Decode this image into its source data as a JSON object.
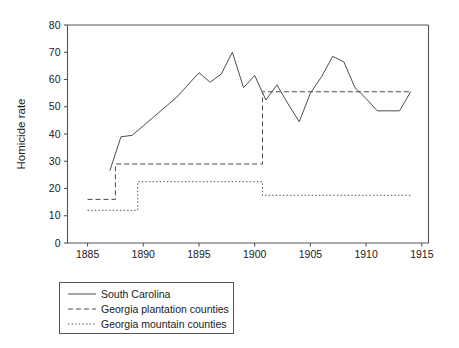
{
  "chart_data": {
    "type": "line",
    "title": "",
    "subtitle": "",
    "xlabel": "",
    "ylabel": "Homicide rate",
    "xlim": [
      1883.2,
      1915.6
    ],
    "ylim": [
      0,
      80
    ],
    "grid": false,
    "legend_position": "below-plot-left",
    "x_ticks": [
      1885,
      1890,
      1895,
      1900,
      1905,
      1910,
      1915
    ],
    "x_tick_labels": [
      "1885",
      "1890",
      "1895",
      "1900",
      "1905",
      "1910",
      "1915"
    ],
    "y_ticks": [
      0,
      10,
      20,
      30,
      40,
      50,
      60,
      70,
      80
    ],
    "y_tick_labels": [
      "0",
      "10",
      "20",
      "30",
      "40",
      "50",
      "60",
      "70",
      "80"
    ],
    "series": [
      {
        "name": "South Carolina",
        "style": "solid",
        "color": "#4d4d4d",
        "x": [
          1887,
          1888,
          1889,
          1890,
          1891,
          1892,
          1893,
          1894,
          1895,
          1896,
          1897,
          1898,
          1899,
          1900,
          1901,
          1902,
          1903,
          1904,
          1905,
          1906,
          1907,
          1908,
          1909,
          1910,
          1911,
          1912,
          1913,
          1914
        ],
        "values": [
          26.5,
          39.0,
          39.5,
          43.0,
          46.5,
          50.0,
          53.5,
          58.0,
          62.5,
          59.0,
          62.0,
          70.0,
          57.0,
          61.5,
          52.5,
          58.0,
          51.0,
          44.5,
          55.0,
          61.0,
          68.5,
          66.5,
          57.0,
          53.0,
          48.5,
          48.5,
          48.5,
          55.5
        ]
      },
      {
        "name": "Georgia plantation counties",
        "style": "dashed",
        "color": "#4d4d4d",
        "steps": [
          {
            "from": 1885.0,
            "to": 1887.5,
            "value": 16.0
          },
          {
            "from": 1887.5,
            "to": 1900.7,
            "value": 29.0
          },
          {
            "from": 1900.7,
            "to": 1914.0,
            "value": 55.5
          }
        ]
      },
      {
        "name": "Georgia mountain counties",
        "style": "dotted",
        "color": "#4d4d4d",
        "steps": [
          {
            "from": 1885.0,
            "to": 1889.5,
            "value": 12.0
          },
          {
            "from": 1889.5,
            "to": 1900.7,
            "value": 22.5
          },
          {
            "from": 1900.7,
            "to": 1914.0,
            "value": 17.5
          }
        ]
      }
    ]
  },
  "axes": {
    "y_title": "Homicide rate",
    "x_title": "",
    "y_tick_0": "0",
    "y_tick_1": "10",
    "y_tick_2": "20",
    "y_tick_3": "30",
    "y_tick_4": "40",
    "y_tick_5": "50",
    "y_tick_6": "60",
    "y_tick_7": "70",
    "y_tick_8": "80",
    "x_tick_0": "1885",
    "x_tick_1": "1890",
    "x_tick_2": "1895",
    "x_tick_3": "1900",
    "x_tick_4": "1905",
    "x_tick_5": "1910",
    "x_tick_6": "1915"
  },
  "legend": {
    "items": [
      {
        "label": "South Carolina",
        "style": "solid"
      },
      {
        "label": "Georgia plantation counties",
        "style": "dashed"
      },
      {
        "label": "Georgia mountain counties",
        "style": "dotted"
      }
    ]
  },
  "colors": {
    "line": "#4d4d4d",
    "axis": "#555555",
    "text": "#1a1a1a",
    "background": "#ffffff"
  }
}
